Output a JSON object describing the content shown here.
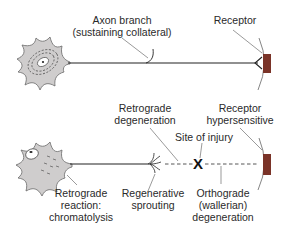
{
  "colors": {
    "soma_fill": "#cfcdcd",
    "soma_stroke": "#6a6a6a",
    "axon": "#222222",
    "receptor_fill": "#7a3328",
    "leader": "#555555"
  },
  "top_panel": {
    "axon_branch_label": [
      "Axon branch",
      "(sustaining collateral)"
    ],
    "receptor_label": "Receptor"
  },
  "bottom_panel": {
    "retrograde_degeneration_label": [
      "Retrograde",
      "degeneration"
    ],
    "receptor_hypersensitive_label": [
      "Receptor",
      "hypersensitive"
    ],
    "site_of_injury_label": "Site of injury",
    "injury_marker": "X",
    "retrograde_reaction_label": [
      "Retrograde",
      "reaction:",
      "chromatolysis"
    ],
    "regenerative_sprouting_label": [
      "Regenerative",
      "sprouting"
    ],
    "orthograde_label": [
      "Orthograde",
      "(wallerian)",
      "degeneration"
    ]
  }
}
